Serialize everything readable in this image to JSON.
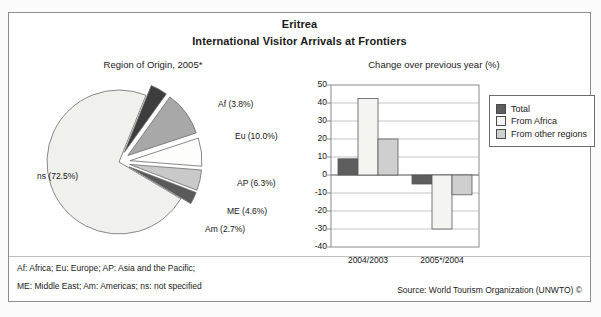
{
  "header": {
    "country": "Eritrea",
    "title": "International Visitor Arrivals at Frontiers"
  },
  "pie_subtitle": "Region of Origin, 2005*",
  "bar_subtitle": "Change over previous year (%)",
  "footer": {
    "note_line1": "Af: Africa; Eu: Europe; AP: Asia and the Pacific;",
    "note_line2": "ME: Middle East; Am: Americas; ns: not specified",
    "source": "Source: World Tourism Organization (UNWTO) ©"
  },
  "legend": {
    "items": [
      {
        "label": "Total",
        "color": "#5e5e5e"
      },
      {
        "label": "From Africa",
        "color": "#f4f4f0"
      },
      {
        "label": "From other regions",
        "color": "#cfcfcf"
      }
    ]
  },
  "chart_data": [
    {
      "type": "pie",
      "title": "Region of Origin, 2005*",
      "unit": "percent",
      "categories": [
        "Af",
        "Eu",
        "AP",
        "ME",
        "Am",
        "ns"
      ],
      "labels": [
        "Af (3.8%)",
        "Eu (10.0%)",
        "AP (6.3%)",
        "ME (4.6%)",
        "Am (2.7%)",
        "ns (72.5%)"
      ],
      "values": [
        3.8,
        10.0,
        6.3,
        4.6,
        2.7,
        72.5
      ],
      "colors": [
        "#3d3d3d",
        "#a8a8a8",
        "#fdfdfb",
        "#c9c9c9",
        "#5a5a5a",
        "#f0f0ec"
      ],
      "exploded": [
        true,
        true,
        true,
        true,
        true,
        false
      ],
      "legend_position": "none"
    },
    {
      "type": "bar",
      "title": "Change over previous year (%)",
      "categories": [
        "2004/2003",
        "2005*/2004"
      ],
      "series": [
        {
          "name": "Total",
          "values": [
            9,
            -5
          ],
          "color": "#5e5e5e"
        },
        {
          "name": "From Africa",
          "values": [
            42.5,
            -30
          ],
          "color": "#f4f4f0"
        },
        {
          "name": "From other regions",
          "values": [
            20,
            -11
          ],
          "color": "#cfcfcf"
        }
      ],
      "ylabel": "",
      "xlabel": "",
      "ylim": [
        -40,
        50
      ],
      "yticks": [
        50,
        40,
        30,
        20,
        10,
        0,
        -10,
        -20,
        -30,
        -40
      ],
      "ytick_labels": [
        "50",
        "40",
        "30",
        "20",
        "10",
        "0",
        "-10",
        "-20",
        "-30",
        "-40"
      ],
      "grid": true,
      "legend_position": "right"
    }
  ]
}
